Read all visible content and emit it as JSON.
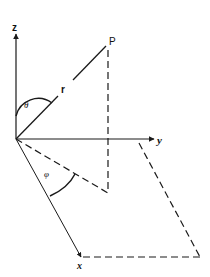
{
  "diagram": {
    "type": "spherical-coordinates",
    "labels": {
      "z_axis": "z",
      "y_axis": "y",
      "x_axis": "x",
      "point": "P",
      "radius": "r",
      "polar_angle": "θ",
      "azimuth_angle": "φ"
    },
    "colors": {
      "stroke": "#1a1a1a",
      "background": "#ffffff"
    }
  }
}
